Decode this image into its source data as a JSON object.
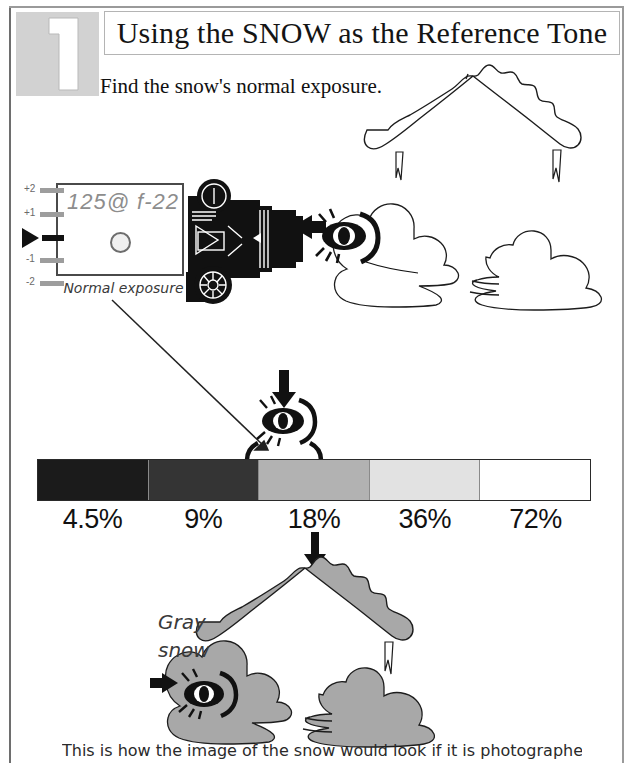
{
  "page": {
    "step_number": "1",
    "title": "Using the SNOW as the Reference Tone",
    "subtitle": "Find the snow's normal exposure.",
    "caption": "This is how the image of the snow would look if it is photographed"
  },
  "meter": {
    "reading": "125@ f-22",
    "caption": "Normal exposure",
    "scale": [
      {
        "label": "+2"
      },
      {
        "label": "+1"
      },
      {
        "label": "0"
      },
      {
        "label": "-1"
      },
      {
        "label": "-2"
      }
    ]
  },
  "grayscale": {
    "segments": [
      {
        "pct": "4.5%",
        "color": "#1b1b1b"
      },
      {
        "pct": "9%",
        "color": "#343434"
      },
      {
        "pct": "18%",
        "color": "#b2b2b2"
      },
      {
        "pct": "36%",
        "color": "#e2e2e2"
      },
      {
        "pct": "72%",
        "color": "#ffffff"
      }
    ]
  },
  "annotations": {
    "gray_snow_line1": "Gray",
    "gray_snow_line2": "snow"
  },
  "colors": {
    "ink": "#111111",
    "gray_fill": "#a8a8a8",
    "step_box": "#d2d2d2",
    "lcd_text": "#8d8d8d"
  }
}
